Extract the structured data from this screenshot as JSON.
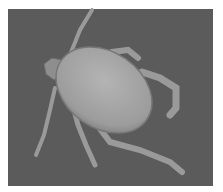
{
  "image": {
    "subject": "tick",
    "description": "Grayscale scanning electron micrograph of a tick on a dark gray background",
    "colors": {
      "background": "#5b5b5b",
      "body": "#a8a8a8",
      "body_edge": "#8a8a8a",
      "legs": "#9a9a9a",
      "frame": "#ffffff"
    }
  }
}
